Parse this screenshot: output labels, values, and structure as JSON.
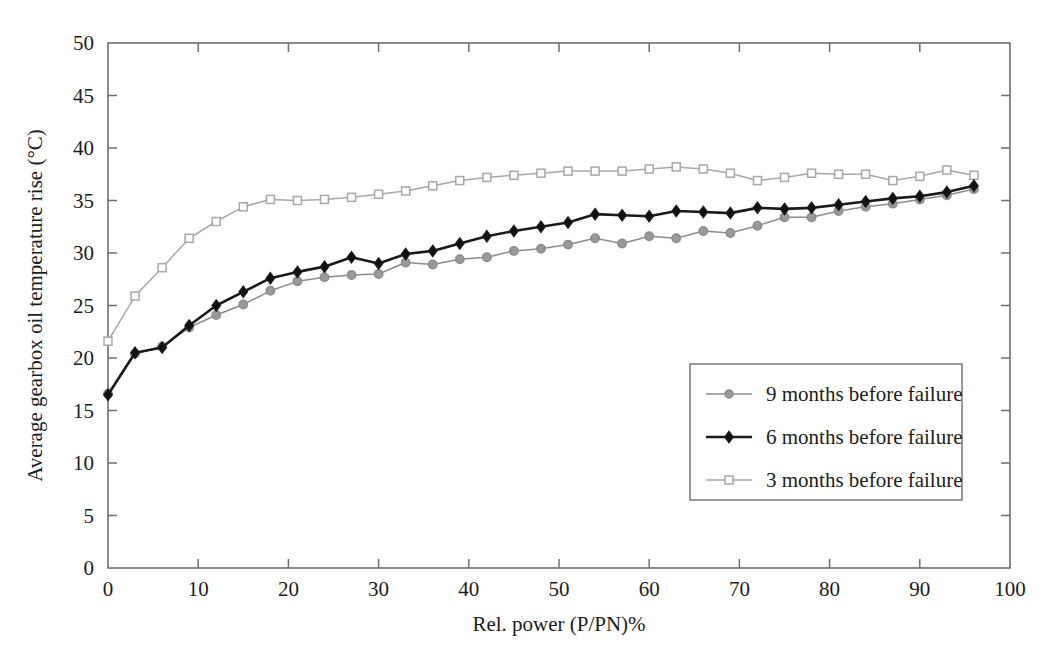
{
  "chart_data": {
    "type": "line",
    "title": "",
    "xlabel": "Rel. power (P/PN)%",
    "ylabel": "Average gearbox oil temperature rise (°C)",
    "xlim": [
      0,
      100
    ],
    "ylim": [
      0,
      50
    ],
    "xticks": [
      0,
      10,
      20,
      30,
      40,
      50,
      60,
      70,
      80,
      90,
      100
    ],
    "yticks": [
      0,
      5,
      10,
      15,
      20,
      25,
      30,
      35,
      40,
      45,
      50
    ],
    "grid": false,
    "legend_position": "center-right",
    "x": [
      0,
      3,
      6,
      9,
      12,
      15,
      18,
      21,
      24,
      27,
      30,
      33,
      36,
      39,
      42,
      45,
      48,
      51,
      54,
      57,
      60,
      63,
      66,
      69,
      72,
      75,
      78,
      81,
      84,
      87,
      90,
      93,
      96
    ],
    "series": [
      {
        "name": "9 months before failure",
        "color": "#8c8c8c",
        "marker": "circle",
        "marker_fill": "#9a9a9a",
        "values": [
          16.6,
          20.4,
          21.1,
          22.9,
          24.1,
          25.1,
          26.4,
          27.3,
          27.7,
          27.9,
          28.0,
          29.1,
          28.9,
          29.4,
          29.6,
          30.2,
          30.4,
          30.8,
          31.4,
          30.9,
          31.6,
          31.4,
          32.1,
          31.9,
          32.6,
          33.4,
          33.4,
          34.0,
          34.4,
          34.7,
          35.1,
          35.5,
          36.1
        ]
      },
      {
        "name": "6 months before failure",
        "color": "#1a1a1a",
        "marker": "diamond",
        "marker_fill": "#111111",
        "values": [
          16.5,
          20.5,
          21.0,
          23.1,
          25.0,
          26.3,
          27.6,
          28.2,
          28.7,
          29.6,
          29.0,
          29.9,
          30.2,
          30.9,
          31.6,
          32.1,
          32.5,
          32.9,
          33.7,
          33.6,
          33.5,
          34.0,
          33.9,
          33.8,
          34.3,
          34.2,
          34.3,
          34.6,
          34.9,
          35.2,
          35.4,
          35.8,
          36.4
        ]
      },
      {
        "name": "3 months before failure",
        "color": "#a8a8a8",
        "marker": "square",
        "marker_fill": "#ffffff",
        "values": [
          21.6,
          25.9,
          28.6,
          31.4,
          33.0,
          34.4,
          35.1,
          35.0,
          35.1,
          35.3,
          35.6,
          35.9,
          36.4,
          36.9,
          37.2,
          37.4,
          37.6,
          37.8,
          37.8,
          37.8,
          38.0,
          38.2,
          38.0,
          37.6,
          36.9,
          37.2,
          37.6,
          37.5,
          37.5,
          36.9,
          37.3,
          37.9,
          37.4
        ]
      }
    ]
  },
  "figure": {
    "plot_left_px": 108,
    "plot_right_px": 1010,
    "plot_top_px": 43,
    "plot_bottom_px": 568
  }
}
